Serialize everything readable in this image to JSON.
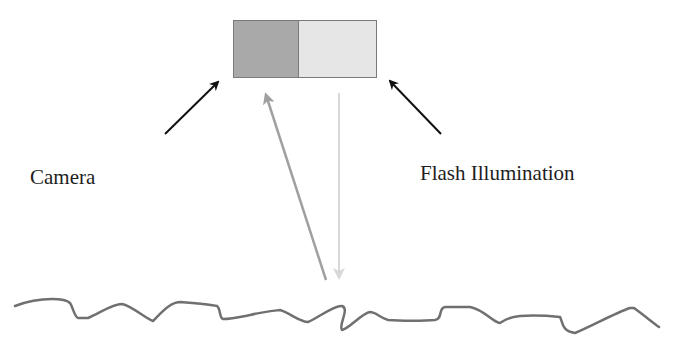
{
  "diagram": {
    "labels": {
      "camera": "Camera",
      "flash": "Flash Illumination"
    },
    "device": {
      "camera_color": "#a9a9a9",
      "flash_color": "#e6e6e6",
      "border_color": "#7a7a7a"
    },
    "arrows": {
      "pointer_color": "#111111",
      "reflected_color": "#a0a0a0",
      "incident_color": "#d8d8d8"
    },
    "surface_color": "#707070"
  }
}
